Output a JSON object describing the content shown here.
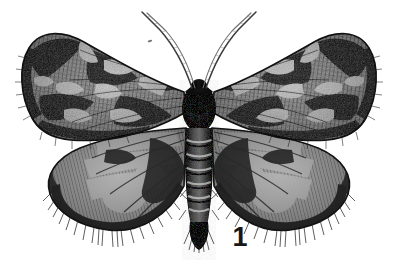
{
  "plate": {
    "background_color": "#ffffff",
    "ink_color": "#1a1a1a",
    "medium": "monochrome engraving / halftone plate",
    "subject": "moth specimen, wings spread, dorsal view",
    "figure_label": "1",
    "figure_label_color": "#171717"
  },
  "specimen": {
    "head": {
      "name": "head"
    },
    "antennae": {
      "count": 2,
      "left": {
        "name": "left-antenna"
      },
      "right": {
        "name": "right-antenna"
      }
    },
    "thorax": {
      "name": "thorax",
      "tone": "very dark"
    },
    "abdomen": {
      "name": "abdomen",
      "segment_bands": 6,
      "tone": "dark with pale transverse bands"
    },
    "forewings": {
      "left": {
        "name": "left-forewing",
        "pattern": "mottled dark with pale zigzag median and subterminal bands"
      },
      "right": {
        "name": "right-forewing",
        "pattern": "mottled dark with pale zigzag median and subterminal bands"
      }
    },
    "hindwings": {
      "left": {
        "name": "left-hindwing",
        "pattern": "pale grey cells, dark veins, broad dark terminal border, hairy fringe"
      },
      "right": {
        "name": "right-hindwing",
        "pattern": "pale grey cells, dark veins, broad dark terminal border, hairy fringe"
      }
    },
    "speck": {
      "name": "plate-speck",
      "note": "small ink speck upper-left of antennae"
    }
  },
  "palette": {
    "paper": "#ffffff",
    "darkest": "#141414",
    "dark": "#2e2e2e",
    "mid": "#5a5a5a",
    "light_mid": "#8e8e8e",
    "pale": "#c4c4c4",
    "palest": "#e3e3e3"
  }
}
